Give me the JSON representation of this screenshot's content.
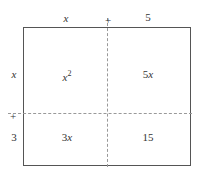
{
  "diagram": {
    "type": "area-model",
    "top_labels": {
      "left": "x",
      "plus": "+",
      "right": "5"
    },
    "side_labels": {
      "top": "x",
      "plus": "+",
      "bottom": "3"
    },
    "cells": {
      "top_left": {
        "base": "x",
        "sup": "2"
      },
      "top_right": "5x",
      "bottom_left": "3x",
      "bottom_right": "15"
    },
    "colors": {
      "border": "#555555",
      "dash": "#999999",
      "text": "#333333"
    }
  }
}
